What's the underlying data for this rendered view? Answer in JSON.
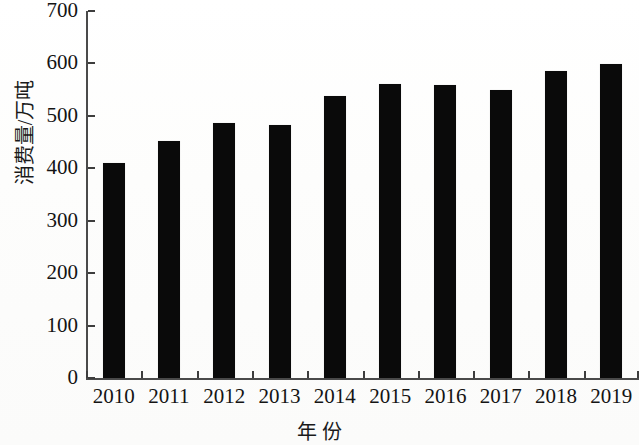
{
  "chart_data": {
    "type": "bar",
    "title": "",
    "xlabel": "年 份",
    "ylabel": "消费量/万吨",
    "categories": [
      "2010",
      "2011",
      "2012",
      "2013",
      "2014",
      "2015",
      "2016",
      "2017",
      "2018",
      "2019"
    ],
    "values": [
      411,
      453,
      487,
      483,
      537,
      561,
      558,
      549,
      586,
      598
    ],
    "ylim": [
      0,
      700
    ],
    "yticks": [
      0,
      100,
      200,
      300,
      400,
      500,
      600,
      700
    ],
    "ytick_labels": [
      "0",
      "100",
      "200",
      "300",
      "400",
      "500",
      "600",
      "700"
    ],
    "grid": false,
    "legend": null,
    "bar_color": "#0a0a0a",
    "axis_color": "#4a4a4a",
    "background_color": "#ffffff",
    "series": [
      {
        "name": "消费量",
        "values": [
          411,
          453,
          487,
          483,
          537,
          561,
          558,
          549,
          586,
          598
        ]
      }
    ]
  }
}
